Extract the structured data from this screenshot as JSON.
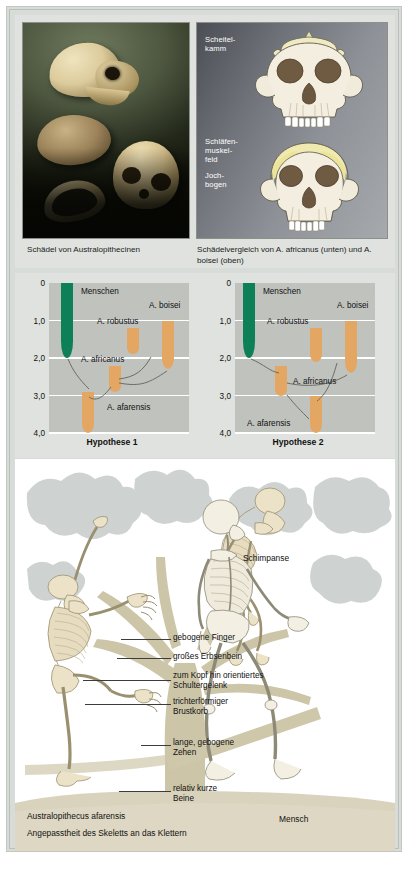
{
  "top": {
    "diagram_labels": {
      "scheitelkamm": "Scheitel-\nkamm",
      "schlaefenmuskelfeld": "Schläfen-\nmuskel-\nfeld",
      "jochbogen": "Joch-\nbogen"
    },
    "caption_left": "Schädel von Australopithecinen",
    "caption_right": "Schädelvergleich von A. africanus (unten) und A. boisei (oben)"
  },
  "charts": [
    {
      "title": "Hypothese 1",
      "axis_label_unit": "Mio. Jahre",
      "ticks": [
        "0",
        "1,0",
        "2,0",
        "3,0",
        "4,0"
      ],
      "tick_values": [
        0,
        1.0,
        2.0,
        3.0,
        4.0
      ],
      "ylim": [
        0,
        4.0
      ],
      "taxa": [
        {
          "name": "Menschen",
          "from": 0.0,
          "to": 2.0,
          "color": "#0e8058",
          "x": 0.13
        },
        {
          "name": "A. robustus",
          "from": 1.2,
          "to": 1.9,
          "color": "#e3a763",
          "x": 0.6
        },
        {
          "name": "A. boisei",
          "from": 1.0,
          "to": 2.3,
          "color": "#e3a763",
          "x": 0.85
        },
        {
          "name": "A. africanus",
          "from": 2.2,
          "to": 2.9,
          "color": "#e3a763",
          "x": 0.47
        },
        {
          "name": "A. afarensis",
          "from": 2.9,
          "to": 4.0,
          "color": "#e3a763",
          "x": 0.28
        }
      ]
    },
    {
      "title": "Hypothese 2",
      "axis_label_unit": "Mio. Jahre",
      "ticks": [
        "0",
        "1,0",
        "2,0",
        "3,0",
        "4,0"
      ],
      "tick_values": [
        0,
        1.0,
        2.0,
        3.0,
        4.0
      ],
      "ylim": [
        0,
        4.0
      ],
      "taxa": [
        {
          "name": "Menschen",
          "from": 0.0,
          "to": 2.0,
          "color": "#0e8058",
          "x": 0.1
        },
        {
          "name": "A. robustus",
          "from": 1.2,
          "to": 2.1,
          "color": "#e3a763",
          "x": 0.58
        },
        {
          "name": "A. boisei",
          "from": 1.0,
          "to": 2.4,
          "color": "#e3a763",
          "x": 0.83
        },
        {
          "name": "A. africanus",
          "from": 2.2,
          "to": 3.0,
          "color": "#e3a763",
          "x": 0.33
        },
        {
          "name": "A. afarensis",
          "from": 3.0,
          "to": 4.0,
          "color": "#e3a763",
          "x": 0.58
        }
      ]
    }
  ],
  "chart_data": {
    "type": "bar",
    "ylabel": "Mio. Jahre",
    "xlabel": "",
    "ylim": [
      0,
      4.0
    ],
    "ytick_labels": [
      "0",
      "1,0",
      "2,0",
      "3,0",
      "4,0"
    ],
    "grid": true,
    "legend": "none",
    "panels": [
      {
        "title": "Hypothese 1",
        "categories": [
          "Menschen",
          "A. robustus",
          "A. boisei",
          "A. africanus",
          "A. afarensis"
        ],
        "ranges_mio_jahre": [
          [
            0.0,
            2.0
          ],
          [
            1.2,
            1.9
          ],
          [
            1.0,
            2.3
          ],
          [
            2.2,
            2.9
          ],
          [
            2.9,
            4.0
          ]
        ],
        "colors": [
          "#0e8058",
          "#e3a763",
          "#e3a763",
          "#e3a763",
          "#e3a763"
        ],
        "connections": [
          [
            "A. afarensis",
            "Menschen"
          ],
          [
            "A. afarensis",
            "A. africanus"
          ],
          [
            "A. africanus",
            "A. robustus"
          ],
          [
            "A. africanus",
            "A. boisei"
          ]
        ]
      },
      {
        "title": "Hypothese 2",
        "categories": [
          "Menschen",
          "A. robustus",
          "A. boisei",
          "A. africanus",
          "A. afarensis"
        ],
        "ranges_mio_jahre": [
          [
            0.0,
            2.0
          ],
          [
            1.2,
            2.1
          ],
          [
            1.0,
            2.4
          ],
          [
            2.2,
            3.0
          ],
          [
            3.0,
            4.0
          ]
        ],
        "colors": [
          "#0e8058",
          "#e3a763",
          "#e3a763",
          "#e3a763",
          "#e3a763"
        ],
        "connections": [
          [
            "A. afarensis",
            "A. africanus"
          ],
          [
            "A. africanus",
            "Menschen"
          ],
          [
            "A. afarensis",
            "A. robustus"
          ],
          [
            "A. afarensis",
            "A. boisei"
          ]
        ]
      }
    ]
  },
  "bottom": {
    "chimp_label": "Schimpanse",
    "human_label": "Mensch",
    "annotations": [
      "gebogene Finger",
      "großes Erbsenbein",
      "zum Kopf hin orientiertes\nSchultergelenk",
      "trichterförmiger\nBrustkorb",
      "lange, gebogene\nZehen",
      "relativ kurze\nBeine"
    ],
    "species_label": "Australopithecus afarensis",
    "subtitle": "Angepasstheit des Skeletts an das Klettern"
  },
  "colors": {
    "frame": "#d8dcd8",
    "panel": "#dfe2de",
    "plot": "#bfc2bd",
    "green": "#0e8058",
    "orange": "#e3a763",
    "ground": "#d9d2bd",
    "bone": "#ece2c8",
    "foliage": "#c3c9c9"
  }
}
